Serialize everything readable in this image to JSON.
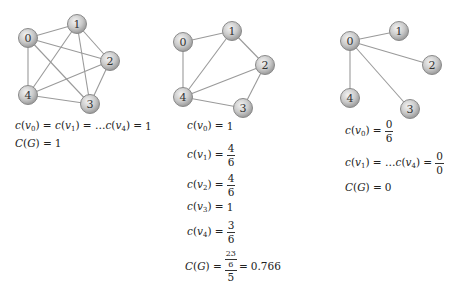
{
  "figure": {
    "node_fill": "#cfcfcf",
    "node_stroke": "#8a8a8a",
    "edge_color": "#9a9a9a"
  },
  "graphs": [
    {
      "id": "complete",
      "nodes": [
        {
          "label": "0",
          "x": 28,
          "y": 38
        },
        {
          "label": "1",
          "x": 77,
          "y": 24
        },
        {
          "label": "2",
          "x": 110,
          "y": 61
        },
        {
          "label": "3",
          "x": 90,
          "y": 104
        },
        {
          "label": "4",
          "x": 28,
          "y": 95
        }
      ],
      "edges": [
        [
          0,
          1
        ],
        [
          0,
          2
        ],
        [
          0,
          3
        ],
        [
          0,
          4
        ],
        [
          1,
          2
        ],
        [
          1,
          3
        ],
        [
          1,
          4
        ],
        [
          2,
          3
        ],
        [
          2,
          4
        ],
        [
          3,
          4
        ]
      ],
      "equations": {
        "line1_lhs": "c(v₀) = c(v₁) = …c(v₄) = 1",
        "c0": "c(",
        "v": "v",
        "eq": " = ",
        "all_value": "1",
        "global": "C(G) = 1"
      }
    },
    {
      "id": "partial",
      "nodes": [
        {
          "label": "0",
          "x": 183,
          "y": 42
        },
        {
          "label": "1",
          "x": 232,
          "y": 31
        },
        {
          "label": "2",
          "x": 265,
          "y": 65
        },
        {
          "label": "3",
          "x": 243,
          "y": 108
        },
        {
          "label": "4",
          "x": 183,
          "y": 97
        }
      ],
      "edges": [
        [
          0,
          1
        ],
        [
          0,
          4
        ],
        [
          1,
          2
        ],
        [
          1,
          4
        ],
        [
          2,
          4
        ],
        [
          2,
          3
        ],
        [
          3,
          4
        ]
      ],
      "equations": {
        "c0_value": "1",
        "c1_num": "4",
        "c1_den": "6",
        "c2_num": "4",
        "c2_den": "6",
        "c3_value": "1",
        "c4_num": "3",
        "c4_den": "6",
        "global_inner_num": "23",
        "global_inner_den": "6",
        "global_den": "5",
        "global_value": "0.766"
      }
    },
    {
      "id": "star",
      "nodes": [
        {
          "label": "0",
          "x": 350,
          "y": 41
        },
        {
          "label": "1",
          "x": 399,
          "y": 31
        },
        {
          "label": "2",
          "x": 432,
          "y": 65
        },
        {
          "label": "3",
          "x": 410,
          "y": 109
        },
        {
          "label": "4",
          "x": 350,
          "y": 98
        }
      ],
      "edges": [
        [
          0,
          1
        ],
        [
          0,
          2
        ],
        [
          0,
          3
        ],
        [
          0,
          4
        ]
      ],
      "equations": {
        "c0_num": "0",
        "c0_den": "6",
        "rest_num": "0",
        "rest_den": "0",
        "global_value": "0"
      }
    }
  ],
  "text": {
    "eq": "=",
    "dots": "…",
    "c": "c",
    "v": "v",
    "C": "C",
    "G": "G"
  }
}
